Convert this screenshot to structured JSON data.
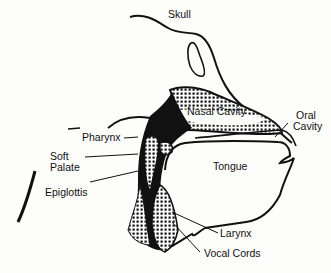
{
  "diagram": {
    "type": "anatomical cross-section",
    "colors": {
      "ink": "#111111",
      "background": "#fdfdfb",
      "stipple": "#111111"
    },
    "labels": {
      "skull": "Skull",
      "nasal_cavity": "Nasal Cavity",
      "oral_cavity_line1": "Oral",
      "oral_cavity_line2": "Cavity",
      "pharynx": "Pharynx",
      "soft_palate_line1": "Soft",
      "soft_palate_line2": "Palate",
      "epiglottis": "Epiglottis",
      "tongue": "Tongue",
      "larynx": "Larynx",
      "vocal_cords": "Vocal Cords"
    }
  }
}
